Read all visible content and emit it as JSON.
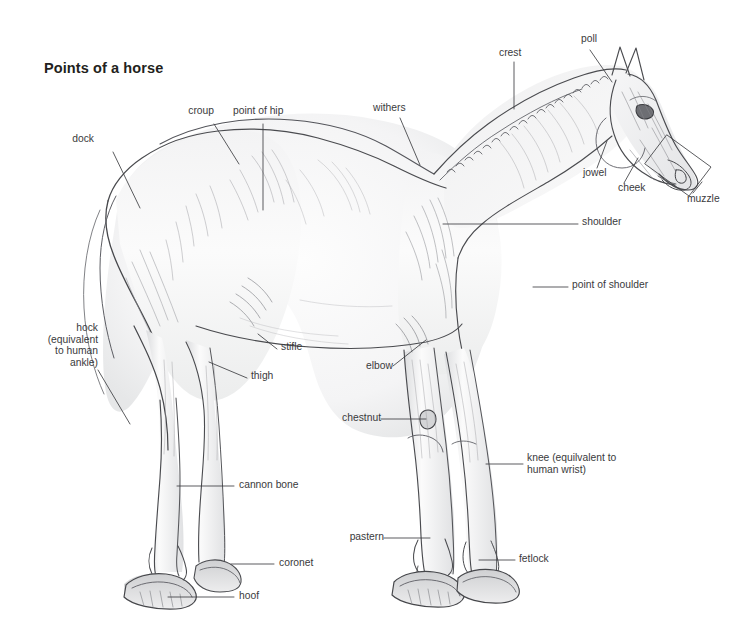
{
  "page": {
    "title": "Points of a horse",
    "background_color": "#ffffff",
    "label_color": "#3a3a3c",
    "title_color": "#231f20",
    "sketch_color": "#55565a",
    "width": 756,
    "height": 638
  },
  "subject": {
    "name": "horse",
    "description": "pencil sketch of a horse in left-facing profile, standing",
    "style": "graphite drawing"
  },
  "labels": [
    {
      "id": "dock",
      "text": "dock",
      "align": "right"
    },
    {
      "id": "croup",
      "text": "croup",
      "align": "right"
    },
    {
      "id": "point-of-hip",
      "text": "point of hip",
      "align": "left"
    },
    {
      "id": "withers",
      "text": "withers",
      "align": "left"
    },
    {
      "id": "crest",
      "text": "crest",
      "align": "left"
    },
    {
      "id": "poll",
      "text": "poll",
      "align": "left"
    },
    {
      "id": "jowel",
      "text": "jowel",
      "align": "left"
    },
    {
      "id": "cheek",
      "text": "cheek",
      "align": "left"
    },
    {
      "id": "muzzle",
      "text": "muzzle",
      "align": "left"
    },
    {
      "id": "shoulder",
      "text": "shoulder",
      "align": "left"
    },
    {
      "id": "point-of-shoulder",
      "text": "point of shoulder",
      "align": "left"
    },
    {
      "id": "hock",
      "text": "hock\n(equivalent\nto human\nankle)",
      "align": "right"
    },
    {
      "id": "stifle",
      "text": "stifle",
      "align": "left"
    },
    {
      "id": "thigh",
      "text": "thigh",
      "align": "left"
    },
    {
      "id": "elbow",
      "text": "elbow",
      "align": "right"
    },
    {
      "id": "chestnut",
      "text": "chestnut",
      "align": "right"
    },
    {
      "id": "knee",
      "text": "knee (equilvalent to\nhuman wrist)",
      "align": "left"
    },
    {
      "id": "cannon-bone",
      "text": "cannon bone",
      "align": "left"
    },
    {
      "id": "pastern",
      "text": "pastern",
      "align": "right"
    },
    {
      "id": "coronet",
      "text": "coronet",
      "align": "left"
    },
    {
      "id": "fetlock",
      "text": "fetlock",
      "align": "left"
    },
    {
      "id": "hoof",
      "text": "hoof",
      "align": "left"
    }
  ]
}
